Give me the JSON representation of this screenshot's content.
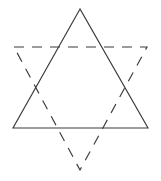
{
  "figure": {
    "background_color": "#ffffff",
    "stroke_color": "#3a3a3a",
    "stroke_width": 1.15,
    "canvas": {
      "width": 161,
      "height": 181
    },
    "shapes": [
      {
        "name": "upward-triangle",
        "line_style": "solid",
        "dash_pattern": null,
        "points": "80,9 13,128 148,128",
        "vertices": [
          {
            "label": "apex",
            "x": 80,
            "y": 9
          },
          {
            "label": "bottom-left",
            "x": 13,
            "y": 128
          },
          {
            "label": "bottom-right",
            "x": 148,
            "y": 128
          }
        ]
      },
      {
        "name": "downward-triangle",
        "line_style": "dashed",
        "dash_pattern": "10 8",
        "points": "14,47 147,47 80,170",
        "vertices": [
          {
            "label": "top-left",
            "x": 14,
            "y": 47
          },
          {
            "label": "top-right",
            "x": 147,
            "y": 47
          },
          {
            "label": "bottom-apex",
            "x": 80,
            "y": 170
          }
        ]
      }
    ]
  }
}
